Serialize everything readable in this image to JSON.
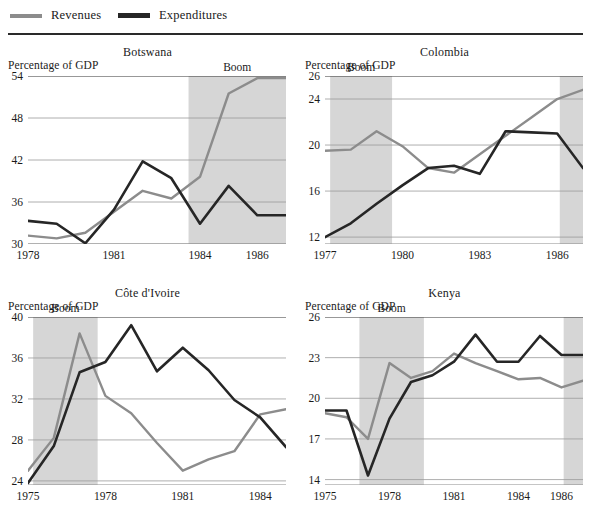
{
  "legend": {
    "items": [
      {
        "label": "Revenues",
        "color": "#8c8c8c",
        "name": "legend-revenues"
      },
      {
        "label": "Expenditures",
        "color": "#262626",
        "name": "legend-expenditures"
      }
    ]
  },
  "axis_caption": "Percentage of GDP",
  "boom_label": "Boom",
  "boom_color": "#d6d6d6",
  "grid_color": "#9a9a9a",
  "chart_data": [
    {
      "type": "line",
      "title": "Botswana",
      "xlabel": "",
      "ylabel": "Percentage of GDP",
      "ylim": [
        30,
        54
      ],
      "yticks": [
        30,
        36,
        42,
        48,
        54
      ],
      "xlim": [
        1978,
        1987
      ],
      "xticks": [
        1978,
        1981,
        1984,
        1986
      ],
      "grid": true,
      "legend_position": "top",
      "annotations": [
        {
          "text": "Boom",
          "x_start": 1983.6,
          "x_end": 1987.0
        }
      ],
      "x": [
        1978,
        1979,
        1980,
        1981,
        1982,
        1983,
        1984,
        1985,
        1986,
        1987
      ],
      "series": [
        {
          "name": "Revenues",
          "color": "#8c8c8c",
          "values": [
            31.2,
            30.8,
            31.6,
            34.6,
            37.6,
            36.5,
            39.6,
            51.5,
            53.7,
            53.7
          ]
        },
        {
          "name": "Expenditures",
          "color": "#262626",
          "values": [
            33.3,
            32.9,
            30.1,
            34.9,
            41.8,
            39.4,
            32.9,
            38.3,
            34.1,
            34.1
          ]
        }
      ]
    },
    {
      "type": "line",
      "title": "Colombia",
      "xlabel": "",
      "ylabel": "Percentage of GDP",
      "ylim": [
        11.4,
        26
      ],
      "yticks": [
        12,
        16,
        20,
        24,
        26
      ],
      "xlim": [
        1977,
        1987
      ],
      "xticks": [
        1977,
        1980,
        1983,
        1986
      ],
      "grid": true,
      "legend_position": "top",
      "annotations": [
        {
          "text": "Boom",
          "x_start": 1977.2,
          "x_end": 1979.6
        },
        {
          "text": "",
          "x_start": 1986.1,
          "x_end": 1987.0
        }
      ],
      "x": [
        1977,
        1978,
        1979,
        1980,
        1981,
        1982,
        1983,
        1984,
        1985,
        1986,
        1987
      ],
      "series": [
        {
          "name": "Revenues",
          "color": "#8c8c8c",
          "values": [
            19.5,
            19.6,
            21.2,
            19.9,
            18.0,
            17.6,
            19.2,
            20.8,
            22.4,
            24.0,
            24.8
          ]
        },
        {
          "name": "Expenditures",
          "color": "#262626",
          "values": [
            12.0,
            13.2,
            14.9,
            16.5,
            18.0,
            18.2,
            17.5,
            21.2,
            21.1,
            21.0,
            18.0
          ]
        }
      ]
    },
    {
      "type": "line",
      "title": "Côte d'Ivoire",
      "xlabel": "",
      "ylabel": "Percentage of GDP",
      "ylim": [
        23.6,
        40
      ],
      "yticks": [
        24,
        28,
        32,
        36,
        40
      ],
      "xlim": [
        1975,
        1985
      ],
      "xticks": [
        1975,
        1978,
        1981,
        1984
      ],
      "grid": true,
      "legend_position": "top",
      "annotations": [
        {
          "text": "Boom",
          "x_start": 1975.2,
          "x_end": 1977.7
        }
      ],
      "x": [
        1975,
        1976,
        1977,
        1978,
        1979,
        1980,
        1981,
        1982,
        1983,
        1984,
        1985
      ],
      "series": [
        {
          "name": "Revenues",
          "color": "#8c8c8c",
          "values": [
            25.0,
            28.2,
            38.4,
            32.3,
            30.6,
            27.7,
            25.0,
            26.1,
            26.9,
            30.5,
            31.0
          ]
        },
        {
          "name": "Expenditures",
          "color": "#262626",
          "values": [
            23.8,
            27.4,
            34.6,
            35.6,
            39.2,
            34.7,
            37.0,
            34.8,
            31.9,
            30.2,
            27.3
          ]
        }
      ]
    },
    {
      "type": "line",
      "title": "Kenya",
      "xlabel": "",
      "ylabel": "Percentage of GDP",
      "ylim": [
        13.6,
        26
      ],
      "yticks": [
        14,
        17,
        20,
        23,
        26
      ],
      "xlim": [
        1975,
        1987
      ],
      "xticks": [
        1975,
        1978,
        1981,
        1984,
        1986
      ],
      "grid": true,
      "legend_position": "top",
      "annotations": [
        {
          "text": "Boom",
          "x_start": 1976.6,
          "x_end": 1979.6
        },
        {
          "text": "",
          "x_start": 1986.1,
          "x_end": 1987.0
        }
      ],
      "x": [
        1975,
        1976,
        1977,
        1978,
        1979,
        1980,
        1981,
        1982,
        1983,
        1984,
        1985,
        1986,
        1987
      ],
      "series": [
        {
          "name": "Revenues",
          "color": "#8c8c8c",
          "values": [
            18.9,
            18.6,
            17.0,
            22.6,
            21.5,
            22.0,
            23.3,
            22.6,
            22.0,
            21.4,
            21.5,
            20.8,
            21.3
          ]
        },
        {
          "name": "Expenditures",
          "color": "#262626",
          "values": [
            19.1,
            19.1,
            14.3,
            18.5,
            21.2,
            21.7,
            22.7,
            24.7,
            22.7,
            22.7,
            24.6,
            23.2,
            23.2
          ]
        }
      ]
    }
  ]
}
